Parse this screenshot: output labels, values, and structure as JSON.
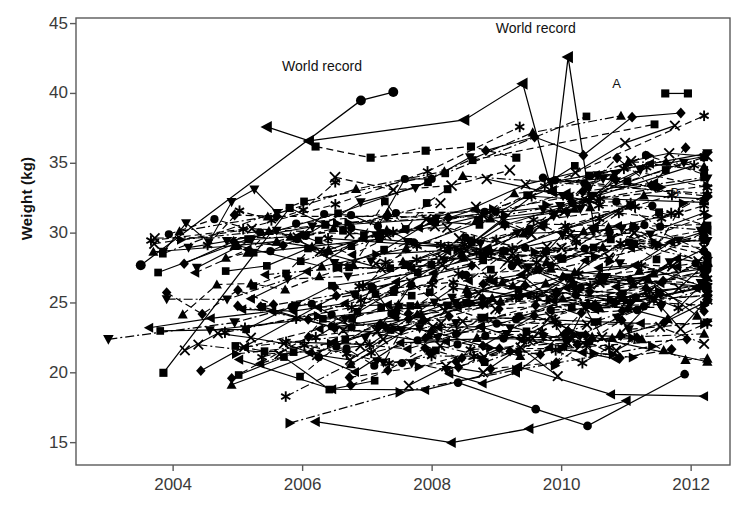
{
  "chart_data": {
    "type": "line",
    "title": "",
    "xlabel": "",
    "ylabel": "Weight (kg)",
    "xlim": [
      2002.5,
      2012.6
    ],
    "ylim": [
      13.4,
      45.4
    ],
    "grid": false,
    "legend": "none",
    "xticks": [
      2004,
      2006,
      2008,
      2010,
      2012
    ],
    "xtick_labels": [
      "2004",
      "2006",
      "2008",
      "2010",
      "2012"
    ],
    "yticks": [
      15,
      20,
      25,
      30,
      35,
      40,
      45
    ],
    "ytick_labels": [
      "15",
      "20",
      "25",
      "30",
      "35",
      "40",
      "45"
    ],
    "annotations": [
      {
        "text": "World record",
        "x": 2006.3,
        "y": 41.6,
        "name": "world-record-label-left"
      },
      {
        "text": "World record",
        "x": 2009.6,
        "y": 44.3,
        "name": "world-record-label-right"
      },
      {
        "text": "A",
        "x": 2010.85,
        "y": 40.4,
        "name": "series-label-a"
      },
      {
        "text": "B",
        "x": 2011.75,
        "y": 32.6,
        "name": "series-label-b"
      }
    ],
    "series": [
      {
        "name": "world-record-circle",
        "marker": "circle",
        "line": "solid",
        "points": [
          [
            2003.5,
            27.7
          ],
          [
            2006.9,
            39.5
          ],
          [
            2007.4,
            40.1
          ]
        ]
      },
      {
        "name": "world-record-left-triangle",
        "marker": "left-triangle",
        "line": "solid",
        "points": [
          [
            2005.45,
            37.6
          ],
          [
            2006.1,
            36.6
          ],
          [
            2008.5,
            38.1
          ],
          [
            2009.4,
            40.7
          ],
          [
            2009.85,
            33.0
          ]
        ]
      },
      {
        "name": "world-record-peak",
        "marker": "left-triangle",
        "line": "solid",
        "points": [
          [
            2009.85,
            33.0
          ],
          [
            2010.1,
            42.6
          ],
          [
            2010.5,
            30.4
          ]
        ]
      },
      {
        "name": "s-diamond-1",
        "marker": "diamond",
        "line": "dashed",
        "points": [
          [
            2004.95,
            31.3
          ],
          [
            2005.6,
            31.2
          ],
          [
            2007.3,
            31.2
          ],
          [
            2008.25,
            31.1
          ]
        ]
      },
      {
        "name": "s-square-1",
        "marker": "square",
        "line": "dashed",
        "points": [
          [
            2006.2,
            36.2
          ],
          [
            2007.05,
            35.4
          ],
          [
            2007.9,
            35.9
          ],
          [
            2008.6,
            36.2
          ],
          [
            2009.3,
            35.4
          ]
        ]
      },
      {
        "name": "s-square-2",
        "marker": "square",
        "line": "solid",
        "points": [
          [
            2003.85,
            20.0
          ],
          [
            2005.8,
            31.8
          ],
          [
            2006.35,
            30.6
          ],
          [
            2007.2,
            30.0
          ]
        ]
      },
      {
        "name": "s-uptri-1",
        "marker": "up-triangle",
        "line": "solid",
        "points": [
          [
            2004.95,
            29.1
          ],
          [
            2005.6,
            29.4
          ],
          [
            2006.4,
            28.8
          ],
          [
            2007.3,
            30.2
          ]
        ]
      },
      {
        "name": "s-downtri-1",
        "marker": "down-triangle",
        "line": "dashdot",
        "points": [
          [
            2003.0,
            22.4
          ],
          [
            2004.95,
            23.6
          ],
          [
            2005.9,
            24.8
          ],
          [
            2006.8,
            25.6
          ]
        ]
      },
      {
        "name": "s-square-3",
        "marker": "square",
        "line": "solid",
        "points": [
          [
            2011.6,
            40.0
          ],
          [
            2011.95,
            40.0
          ]
        ]
      },
      {
        "name": "s-cross-1",
        "marker": "x",
        "line": "dashed",
        "points": [
          [
            2006.5,
            34.0
          ],
          [
            2007.4,
            33.1
          ],
          [
            2008.3,
            33.4
          ],
          [
            2009.2,
            34.5
          ]
        ]
      },
      {
        "name": "s-star-1",
        "marker": "asterisk",
        "line": "dashdot",
        "points": [
          [
            2004.8,
            22.9
          ],
          [
            2005.9,
            23.9
          ],
          [
            2006.9,
            25.2
          ],
          [
            2008.0,
            26.3
          ]
        ]
      },
      {
        "name": "s-righttri-1",
        "marker": "right-triangle",
        "line": "dashdot",
        "points": [
          [
            2005.8,
            16.4
          ],
          [
            2007.5,
            18.6
          ],
          [
            2009.3,
            20.2
          ],
          [
            2011.4,
            21.9
          ]
        ]
      },
      {
        "name": "s-circle-2",
        "marker": "circle",
        "line": "solid",
        "points": [
          [
            2008.4,
            19.3
          ],
          [
            2009.6,
            17.4
          ],
          [
            2010.4,
            16.2
          ],
          [
            2011.9,
            19.9
          ]
        ]
      },
      {
        "name": "s-lefttri-2",
        "marker": "left-triangle",
        "line": "solid",
        "points": [
          [
            2006.2,
            16.5
          ],
          [
            2008.3,
            15.0
          ],
          [
            2009.5,
            16.0
          ],
          [
            2011.0,
            18.0
          ]
        ]
      }
    ],
    "marker_types": [
      "circle",
      "square",
      "diamond",
      "up-triangle",
      "down-triangle",
      "left-triangle",
      "right-triangle",
      "x",
      "asterisk"
    ],
    "line_styles": [
      "solid",
      "dashed",
      "dashdot"
    ]
  }
}
